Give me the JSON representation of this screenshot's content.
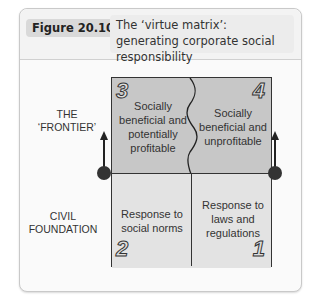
{
  "figure": {
    "label": "Figure 20.10",
    "title": "The ‘virtue matrix’: generating corporate social responsibility"
  },
  "side_labels": {
    "frontier": [
      "THE",
      "‘FRONTIER’"
    ],
    "civil": [
      "CIVIL",
      "FOUNDATION"
    ]
  },
  "quadrants": [
    {
      "number": "3",
      "lines": [
        "Socially",
        "beneficial and",
        "potentially",
        "profitable"
      ],
      "position": "top-left"
    },
    {
      "number": "4",
      "lines": [
        "Socially",
        "beneficial and",
        "unprofitable"
      ],
      "position": "top-right"
    },
    {
      "number": "2",
      "lines": [
        "Response to",
        "social norms"
      ],
      "position": "bottom-left"
    },
    {
      "number": "1",
      "lines": [
        "Response to",
        "laws and",
        "regulations"
      ],
      "position": "bottom-right"
    }
  ],
  "colors": {
    "frontier_fill": "#c7c7c7",
    "foundation_fill": "#e3e3e3",
    "line": "#333333"
  }
}
